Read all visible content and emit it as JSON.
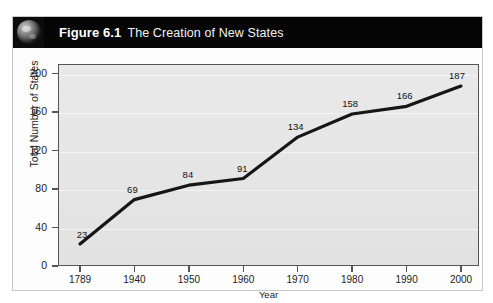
{
  "figure": {
    "icon": "globe-icon",
    "number": "Figure 6.1",
    "caption": "The Creation of New States"
  },
  "chart_data": {
    "type": "line",
    "title": "The Creation of New States",
    "xlabel": "Year",
    "ylabel": "Total Number of States",
    "categories": [
      "1789",
      "1940",
      "1950",
      "1960",
      "1970",
      "1980",
      "1990",
      "2000"
    ],
    "values": [
      23,
      69,
      84,
      91,
      134,
      158,
      166,
      187
    ],
    "point_labels": [
      "23",
      "69",
      "84",
      "91",
      "134",
      "158",
      "166",
      "187"
    ],
    "ylim": [
      0,
      210
    ],
    "yticks": [
      0,
      40,
      80,
      120,
      160,
      200
    ],
    "ytick_labels": [
      "0",
      "40",
      "80",
      "120",
      "160",
      "200"
    ],
    "grid": true,
    "legend": false,
    "line_color": "#161616",
    "plot_bg": "#e6e6e6",
    "axis_color": "#555555"
  }
}
